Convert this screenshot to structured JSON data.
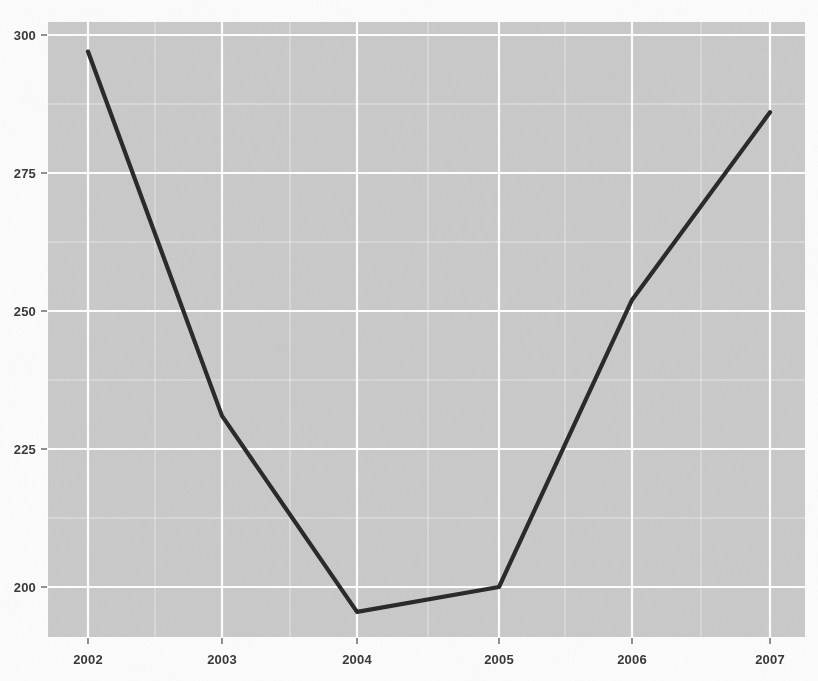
{
  "chart_data": {
    "type": "line",
    "title": "",
    "subtitle": "",
    "xlabel": "",
    "ylabel": "",
    "categories": [
      "2002",
      "2003",
      "2004",
      "2005",
      "2006",
      "2007"
    ],
    "x": [
      2002,
      2003,
      2004,
      2005,
      2006,
      2007
    ],
    "values": [
      297,
      231,
      195.5,
      200,
      252,
      286
    ],
    "series": [
      {
        "name": "series-1",
        "values": [
          297,
          231,
          195.5,
          200,
          252,
          286
        ],
        "color": "#2b2b2b"
      }
    ],
    "xlim": [
      2001.7,
      2007.25
    ],
    "ylim": [
      192.6,
      302.4
    ],
    "xticks": [
      "2002",
      "2003",
      "2004",
      "2005",
      "2006",
      "2007"
    ],
    "yticks": [
      "200",
      "225",
      "250",
      "275",
      "300"
    ],
    "ytick_values": [
      200,
      225,
      250,
      275,
      300
    ],
    "grid": true,
    "grid_color": "#ffffff",
    "minor_grid": true,
    "panel_color": "#cccccc",
    "legend": null,
    "legend_position": "none",
    "annotations": []
  },
  "axis": {
    "y_labels": [
      "300",
      "275",
      "250",
      "225",
      "200"
    ],
    "x_labels": [
      "2002",
      "2003",
      "2004",
      "2005",
      "2006",
      "2007"
    ]
  },
  "style": {
    "line_color": "#2b2b2b",
    "panel_background": "#cccccc",
    "gridline_color": "#ffffff",
    "tick_text_color": "#3a3a3a",
    "page_background": "#fdfdfd"
  }
}
